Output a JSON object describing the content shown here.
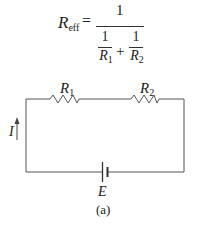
{
  "equation": {
    "lhs": "R",
    "lhs_sub": "eff",
    "equals": "=",
    "numerator": "1",
    "term1": {
      "num": "1",
      "den": "R",
      "den_sub": "1"
    },
    "plus": "+",
    "term2": {
      "num": "1",
      "den": "R",
      "den_sub": "2"
    }
  },
  "circuit": {
    "resistor1": {
      "label": "R",
      "sub": "1"
    },
    "resistor2": {
      "label": "R",
      "sub": "2"
    },
    "current_label": "I",
    "source_label": "E",
    "wire_color": "#444444"
  },
  "caption": "(a)"
}
